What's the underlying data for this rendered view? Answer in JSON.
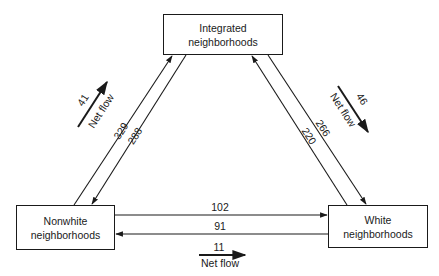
{
  "nodes": {
    "integrated": {
      "line1": "Integrated",
      "line2": "neighborhoods"
    },
    "nonwhite": {
      "line1": "Nonwhite",
      "line2": "neighborhoods"
    },
    "white": {
      "line1": "White",
      "line2": "neighborhoods"
    }
  },
  "flows": {
    "nonwhite_to_integrated": "329",
    "integrated_to_nonwhite": "288",
    "integrated_to_white": "266",
    "white_to_integrated": "220",
    "nonwhite_to_white": "102",
    "white_to_nonwhite": "91"
  },
  "net_flows": {
    "left": {
      "value": "41",
      "label": "Net flow"
    },
    "right": {
      "value": "46",
      "label": "Net flow"
    },
    "bottom": {
      "value": "11",
      "label": "Net flow"
    }
  },
  "colors": {
    "ink": "#1a1a1a",
    "background": "#ffffff"
  }
}
